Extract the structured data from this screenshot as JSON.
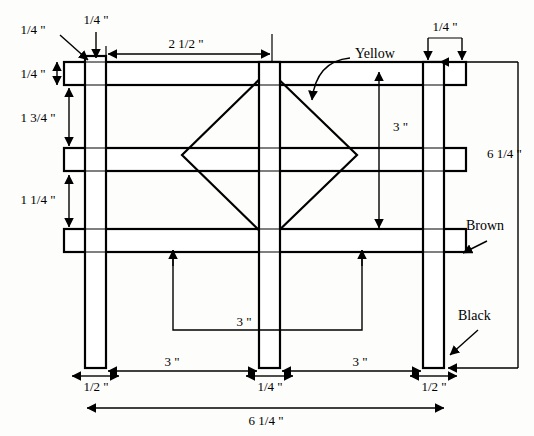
{
  "drawing": {
    "title": "Fence panel assembly dimensioned drawing",
    "units": "inches",
    "stroke_color": "#000000",
    "background_color": "#ffffff",
    "fill_color": "#ffffff"
  },
  "dimensions": {
    "post_top_overhang": "1/4 \"",
    "post_width_top": "1/4 \"",
    "rail_thickness": "1/4 \"",
    "top_rail_to_mid_rail": "1 3/4 \"",
    "mid_rail_to_bottom_rail": "1 1/4 \"",
    "left_post_to_center_post": "2 1/2 \"",
    "right_post_width": "1/4 \"",
    "diamond_height": "3 \"",
    "overall_height": "6 1/4 \"",
    "rail_span_inner": "3 \"",
    "left_post_thickness": "1/2 \"",
    "center_post_thickness": "1/4 \"",
    "right_post_thickness": "1/2 \"",
    "bay_left_width": "3 \"",
    "bay_right_width": "3 \"",
    "overall_width": "6 1/4 \""
  },
  "annotations": {
    "diamond_color_label": "Yellow",
    "rail_color_label": "Brown",
    "post_color_label": "Black"
  },
  "parts": {
    "left_post": "left-post",
    "center_post": "center-post",
    "right_post": "right-post",
    "top_rail": "top-rail",
    "middle_rail": "middle-rail",
    "bottom_rail": "bottom-rail",
    "diamond": "diamond-panel"
  }
}
